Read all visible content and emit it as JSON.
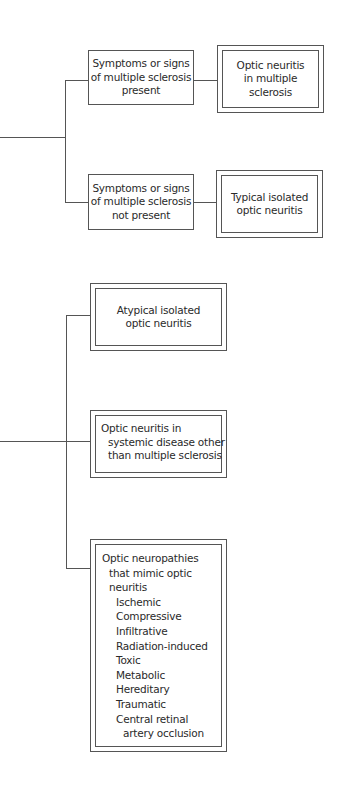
{
  "diagram": {
    "type": "flowchart",
    "branch_a": {
      "condition_1": {
        "label_lines": [
          "Symptoms or signs",
          "of multiple sclerosis",
          "present"
        ],
        "result_lines": [
          "Optic neuritis",
          "in multiple",
          "sclerosis"
        ]
      },
      "condition_2": {
        "label_lines": [
          "Symptoms or signs",
          "of multiple sclerosis",
          "not present"
        ],
        "result_lines": [
          "Typical isolated",
          "optic neuritis"
        ]
      }
    },
    "branch_b": {
      "atypical": {
        "lines": [
          "Atypical isolated",
          "optic neuritis"
        ]
      },
      "systemic": {
        "lines": [
          "Optic neuritis in",
          "systemic disease other",
          "than multiple sclerosis"
        ]
      },
      "mimics": {
        "title_lines": [
          "Optic neuropathies",
          "that mimic optic",
          "neuritis"
        ],
        "items": [
          "Ischemic",
          "Compressive",
          "Infiltrative",
          "Radiation-induced",
          "Toxic",
          "Metabolic",
          "Hereditary",
          "Traumatic",
          "Central retinal"
        ],
        "last_item_continuation": "artery occlusion"
      }
    }
  }
}
